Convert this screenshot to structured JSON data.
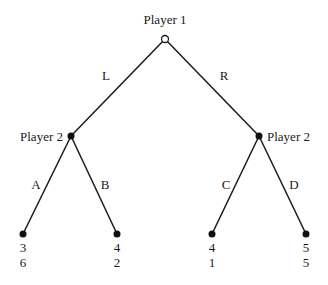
{
  "diagram": {
    "type": "extensive-form game tree",
    "nodes": {
      "root": {
        "label": "Player 1",
        "x": 165,
        "y": 39,
        "style": "hollow"
      },
      "p2_left": {
        "label": "Player 2",
        "x": 71,
        "y": 136,
        "style": "filled"
      },
      "p2_right": {
        "label": "Player 2",
        "x": 259,
        "y": 136,
        "style": "filled"
      }
    },
    "edges": [
      {
        "from": "root",
        "to": "p2_left",
        "label": "L"
      },
      {
        "from": "root",
        "to": "p2_right",
        "label": "R"
      },
      {
        "from": "p2_left",
        "to": "leaf_A",
        "label": "A"
      },
      {
        "from": "p2_left",
        "to": "leaf_B",
        "label": "B"
      },
      {
        "from": "p2_right",
        "to": "leaf_C",
        "label": "C"
      },
      {
        "from": "p2_right",
        "to": "leaf_D",
        "label": "D"
      }
    ],
    "leaves": [
      {
        "id": "leaf_A",
        "x": 23,
        "y": 234,
        "payoff_p1": "3",
        "payoff_p2": "6"
      },
      {
        "id": "leaf_B",
        "x": 117,
        "y": 234,
        "payoff_p1": "4",
        "payoff_p2": "2"
      },
      {
        "id": "leaf_C",
        "x": 212,
        "y": 234,
        "payoff_p1": "4",
        "payoff_p2": "1"
      },
      {
        "id": "leaf_D",
        "x": 306,
        "y": 234,
        "payoff_p1": "5",
        "payoff_p2": "5"
      }
    ]
  },
  "labels": {
    "player1": "Player 1",
    "player2_left": "Player 2",
    "player2_right": "Player 2",
    "edge_L": "L",
    "edge_R": "R",
    "edge_A": "A",
    "edge_B": "B",
    "edge_C": "C",
    "edge_D": "D"
  },
  "payoffs": {
    "A": {
      "p1": "3",
      "p2": "6"
    },
    "B": {
      "p1": "4",
      "p2": "2"
    },
    "C": {
      "p1": "4",
      "p2": "1"
    },
    "D": {
      "p1": "5",
      "p2": "5"
    }
  },
  "colors": {
    "line": "#1a1a1a",
    "background": "#ffffff"
  }
}
